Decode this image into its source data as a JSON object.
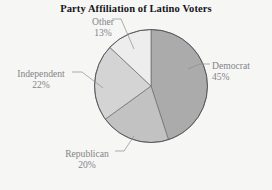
{
  "chart_data": {
    "type": "pie",
    "title": "Party Affiliation of Latino Voters",
    "categories": [
      "Democrat",
      "Republican",
      "Independent",
      "Other"
    ],
    "values": [
      45,
      20,
      22,
      13
    ],
    "value_unit": "%",
    "labels": [
      {
        "name": "Democrat",
        "pct": "45%",
        "slice_color": "#ababab"
      },
      {
        "name": "Republican",
        "pct": "20%",
        "slice_color": "#c2c2c2"
      },
      {
        "name": "Independent",
        "pct": "22%",
        "slice_color": "#d4d4d4"
      },
      {
        "name": "Other",
        "pct": "13%",
        "slice_color": "#ededed"
      }
    ],
    "start_angle_deg": 0,
    "direction": "clockwise",
    "legend": "none",
    "grid": false,
    "label_style": "outside-with-leader-lines",
    "background_color": "#f6f6f4",
    "outline_color": "#58585c",
    "label_text_color": "#84848a",
    "title_color": "#15151a"
  }
}
